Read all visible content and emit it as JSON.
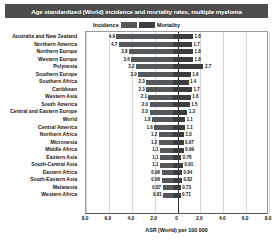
{
  "title": "Age standardized (World) incidence and mortality rates, multiple myeloma",
  "legend": {
    "incidence_label": "Incidence",
    "mortality_label": "Mortality",
    "incidence_color": "#55585b",
    "mortality_color": "#3a3c3e"
  },
  "axis": {
    "xlabel": "ASR (World) per 100 000",
    "ticks": [
      "8.0",
      "6.0",
      "4.0",
      "2.0",
      "0",
      "2.0",
      "4.0",
      "6.0",
      "8.0"
    ]
  },
  "chart_data": {
    "type": "bar",
    "orientation": "horizontal-diverging",
    "title": "Age standardized (World) incidence and mortality rates, multiple myeloma",
    "xlabel": "ASR (World) per 100 000",
    "ylabel": "",
    "xlim": [
      -8,
      8
    ],
    "grid": true,
    "legend_position": "top-center",
    "categories": [
      "Australia and New Zealand",
      "Northern America",
      "Northern Europe",
      "Western Europe",
      "Polynesia",
      "Southern Europe",
      "Southern Africa",
      "Caribbean",
      "Western Asia",
      "South America",
      "Central and Eastern Europe",
      "World",
      "Central America",
      "Northern Africa",
      "Micronesia",
      "Middle Africa",
      "Eastern Asia",
      "South-Central Asia",
      "Eastern Africa",
      "South-Eastern Asia",
      "Melanesia",
      "Western Africa"
    ],
    "series": [
      {
        "name": "Incidence",
        "side": "left",
        "color": "#55585b",
        "values": [
          4.9,
          4.7,
          3.8,
          3.6,
          3.2,
          3.0,
          2.3,
          2.3,
          2.1,
          2.0,
          2.0,
          1.8,
          1.6,
          1.2,
          1.2,
          1.1,
          1.1,
          1.1,
          0.96,
          0.96,
          0.87,
          0.81
        ],
        "labels": [
          "4.9",
          "4.7",
          "3.8",
          "3.6",
          "3.2",
          "3.0",
          "2.3",
          "2.3",
          "2.1",
          "2.0",
          "2.0",
          "1.8",
          "1.6",
          "1.2",
          "1.2",
          "1.1",
          "1.1",
          "1.1",
          "0.96",
          "0.96",
          "0.87",
          "0.81"
        ]
      },
      {
        "name": "Mortality",
        "side": "right",
        "color": "#3a3c3e",
        "values": [
          1.8,
          1.7,
          1.8,
          1.8,
          2.7,
          1.6,
          1.4,
          1.7,
          1.6,
          1.5,
          1.3,
          1.1,
          1.1,
          1.0,
          0.97,
          0.99,
          0.76,
          0.91,
          0.84,
          0.82,
          0.73,
          0.71
        ],
        "labels": [
          "1.8",
          "1.7",
          "1.8",
          "1.8",
          "2.7",
          "1.6",
          "1.4",
          "1.7",
          "1.6",
          "1.5",
          "1.3",
          "1.1",
          "1.1",
          "1.0",
          "0.97",
          "0.99",
          "0.76",
          "0.91",
          "0.84",
          "0.82",
          "0.73",
          "0.71"
        ]
      }
    ]
  }
}
